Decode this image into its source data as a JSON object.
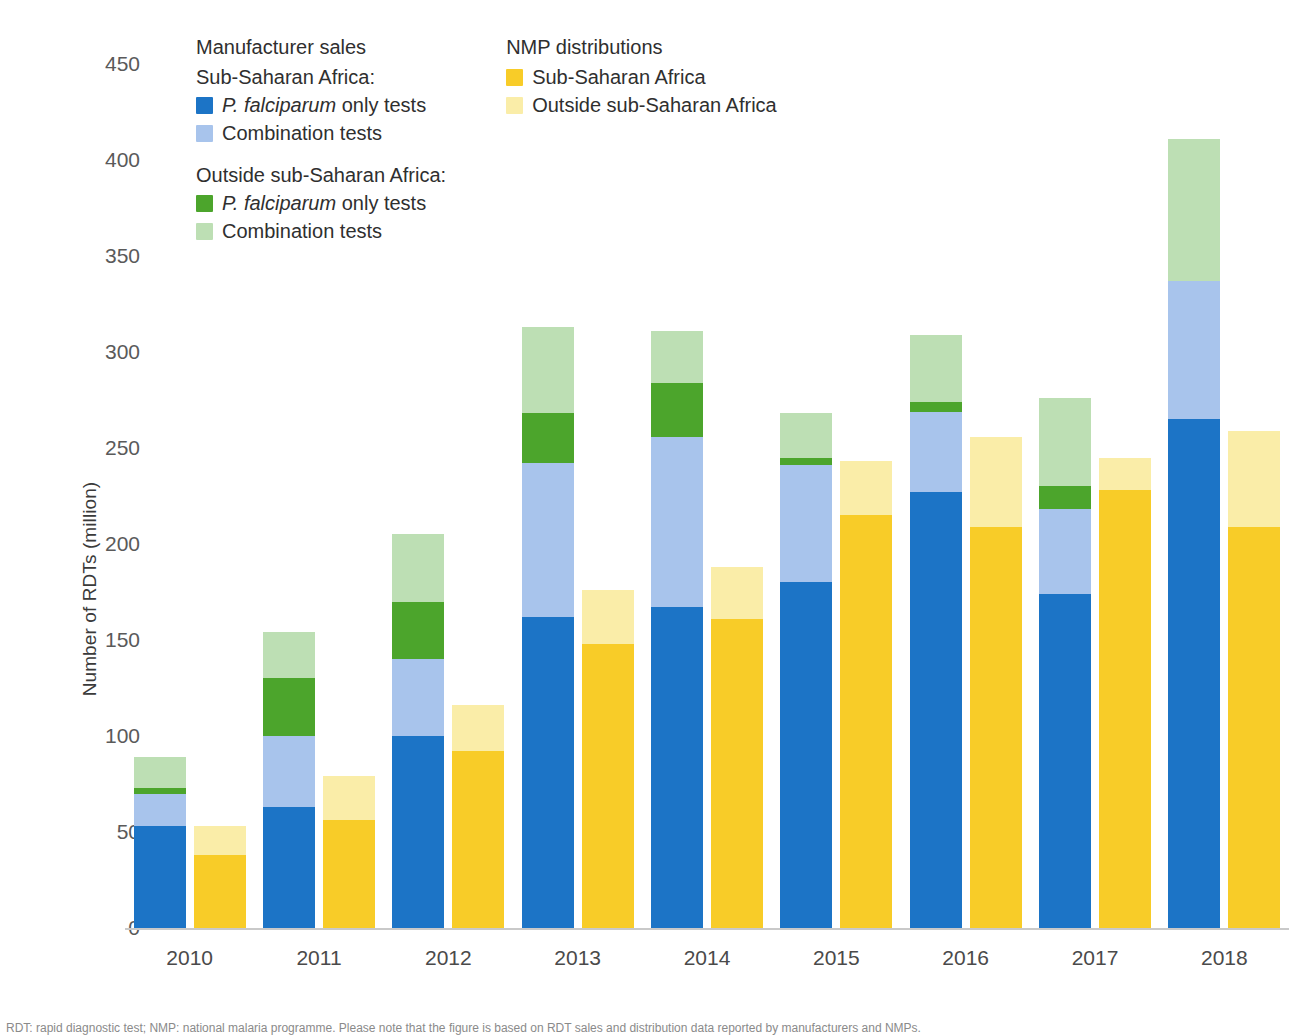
{
  "legend": {
    "columns": [
      {
        "id": "manufacturer-sales",
        "heading": "Manufacturer sales",
        "subheading_1": "Sub-Saharan Africa:",
        "items_1": [
          {
            "label": "P. falciparum only tests",
            "italic_prefix": "P. falciparum",
            "plain_suffix": " only tests",
            "color": "#1C74C6"
          },
          {
            "label": "Combination tests",
            "italic_prefix": "",
            "plain_suffix": "Combination tests",
            "color": "#A8C4EC"
          }
        ],
        "subheading_2": "Outside sub-Saharan Africa:",
        "items_2": [
          {
            "label": "P. falciparum only tests",
            "italic_prefix": "P. falciparum",
            "plain_suffix": " only tests",
            "color": "#4CA52C"
          },
          {
            "label": "Combination tests",
            "italic_prefix": "",
            "plain_suffix": "Combination tests",
            "color": "#BDDFB4"
          }
        ]
      },
      {
        "id": "nmp-distributions",
        "heading": "NMP distributions",
        "subheading_1": "",
        "items_1": [
          {
            "label": "Sub-Saharan Africa",
            "italic_prefix": "",
            "plain_suffix": "Sub-Saharan Africa",
            "color": "#F8CC28"
          },
          {
            "label": "Outside sub-Saharan Africa",
            "italic_prefix": "",
            "plain_suffix": "Outside sub-Saharan Africa",
            "color": "#FAEDA8"
          }
        ],
        "subheading_2": "",
        "items_2": []
      }
    ]
  },
  "footnote": "RDT: rapid diagnostic test; NMP: national malaria programme. Please note that the figure is based on RDT sales and distribution data reported by manufacturers and NMPs.",
  "chart_data": {
    "type": "bar",
    "title": "",
    "xlabel": "",
    "ylabel": "Number of RDTs (million)",
    "ylim": [
      0,
      450
    ],
    "ytick_step": 50,
    "yticks": [
      0,
      50,
      100,
      150,
      200,
      250,
      300,
      350,
      400,
      450
    ],
    "ytick_labels": [
      "0",
      "50",
      "100",
      "150",
      "200",
      "250",
      "300",
      "350",
      "400",
      "450"
    ],
    "grid": false,
    "legend_position": "top-left",
    "stacked": true,
    "grouped": true,
    "categories": [
      "2010",
      "2011",
      "2012",
      "2013",
      "2014",
      "2015",
      "2016",
      "2017",
      "2018"
    ],
    "groups": [
      {
        "name": "Manufacturer sales",
        "series": [
          {
            "name": "Sub-Saharan Africa: P. falciparum only tests",
            "color": "#1C74C6",
            "values": [
              53,
              63,
              100,
              162,
              167,
              180,
              227,
              174,
              265
            ]
          },
          {
            "name": "Sub-Saharan Africa: Combination tests",
            "color": "#A8C4EC",
            "values": [
              17,
              37,
              40,
              80,
              89,
              61,
              42,
              44,
              72
            ]
          },
          {
            "name": "Outside sub-Saharan Africa: P. falciparum only tests",
            "color": "#4CA52C",
            "values": [
              3,
              30,
              30,
              26,
              28,
              4,
              5,
              12,
              0
            ]
          },
          {
            "name": "Outside sub-Saharan Africa: Combination tests",
            "color": "#BDDFB4",
            "values": [
              16,
              24,
              35,
              45,
              27,
              23,
              35,
              46,
              74
            ]
          }
        ],
        "totals": [
          89,
          154,
          205,
          313,
          311,
          268,
          309,
          276,
          411
        ]
      },
      {
        "name": "NMP distributions",
        "series": [
          {
            "name": "Sub-Saharan Africa",
            "color": "#F8CC28",
            "values": [
              38,
              56,
              92,
              148,
              161,
              215,
              209,
              228,
              209
            ]
          },
          {
            "name": "Outside sub-Saharan Africa",
            "color": "#FAEDA8",
            "values": [
              15,
              23,
              24,
              28,
              27,
              28,
              47,
              17,
              50
            ]
          }
        ],
        "totals": [
          53,
          79,
          116,
          176,
          188,
          243,
          256,
          245,
          259
        ]
      }
    ]
  }
}
